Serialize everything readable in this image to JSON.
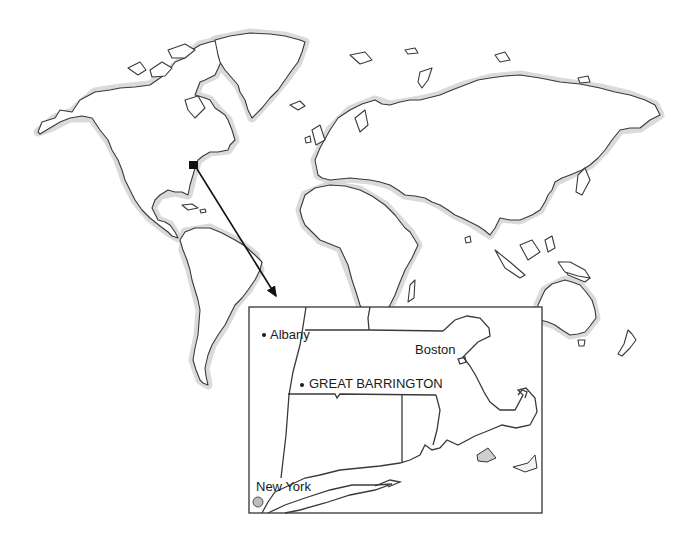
{
  "map": {
    "type": "world-locator-map",
    "marker": {
      "name": "location-marker",
      "x": 193,
      "y": 165
    },
    "arrow": {
      "from": [
        197,
        169
      ],
      "to": [
        277,
        298
      ]
    },
    "inset": {
      "box": {
        "x": 249,
        "y": 307,
        "width": 293,
        "height": 206
      },
      "places": [
        {
          "id": "albany",
          "label": "Albany",
          "dot": [
            264,
            335
          ],
          "text": [
            270,
            328
          ]
        },
        {
          "id": "boston",
          "label": "Boston",
          "dot": null,
          "text": [
            415,
            343
          ]
        },
        {
          "id": "great-barrington",
          "label": "GREAT BARRINGTON",
          "dot": [
            302,
            385
          ],
          "text": [
            309,
            377
          ]
        },
        {
          "id": "new-york",
          "label": "New York",
          "dot": null,
          "text": [
            256,
            480
          ]
        }
      ]
    },
    "colors": {
      "coast": "#3a3a3a",
      "shade": "#d4d4d4",
      "background": "#ffffff"
    }
  }
}
